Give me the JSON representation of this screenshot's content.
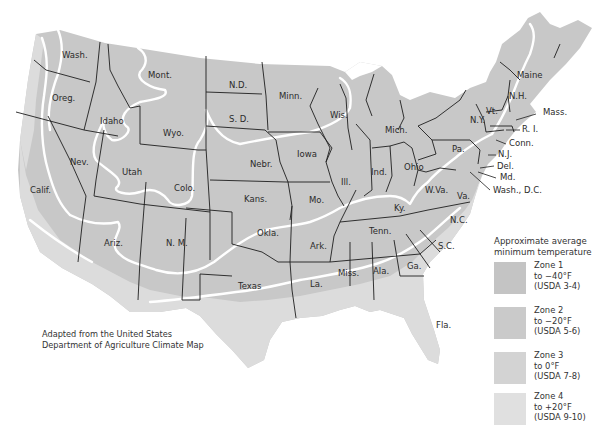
{
  "map": {
    "title": "Plant Hardiness Zones of the United States",
    "colors": {
      "zone1": "#c4c4c4",
      "zone2": "#cacaca",
      "zone3": "#d2d2d2",
      "zone4": "#dedede",
      "border": "#1e1e1e",
      "zone_line": "#ffffff",
      "background": "#ffffff"
    },
    "states": [
      {
        "name": "Wash.",
        "x": 62,
        "y": 58
      },
      {
        "name": "Oreg.",
        "x": 52,
        "y": 101
      },
      {
        "name": "Idaho",
        "x": 100,
        "y": 124
      },
      {
        "name": "Mont.",
        "x": 148,
        "y": 78
      },
      {
        "name": "Wyo.",
        "x": 163,
        "y": 136
      },
      {
        "name": "N.D.",
        "x": 229,
        "y": 88
      },
      {
        "name": "S. D.",
        "x": 229,
        "y": 122
      },
      {
        "name": "Minn.",
        "x": 279,
        "y": 99
      },
      {
        "name": "Wis.",
        "x": 330,
        "y": 118
      },
      {
        "name": "Mich.",
        "x": 385,
        "y": 133
      },
      {
        "name": "Nev.",
        "x": 70,
        "y": 165
      },
      {
        "name": "Utah",
        "x": 122,
        "y": 175
      },
      {
        "name": "Colo.",
        "x": 174,
        "y": 191
      },
      {
        "name": "Nebr.",
        "x": 250,
        "y": 167
      },
      {
        "name": "Iowa",
        "x": 297,
        "y": 157
      },
      {
        "name": "Ill.",
        "x": 341,
        "y": 185
      },
      {
        "name": "Ind.",
        "x": 371,
        "y": 175
      },
      {
        "name": "Ohio",
        "x": 404,
        "y": 170
      },
      {
        "name": "Calif.",
        "x": 30,
        "y": 193
      },
      {
        "name": "Kans.",
        "x": 244,
        "y": 202
      },
      {
        "name": "Mo.",
        "x": 309,
        "y": 203
      },
      {
        "name": "Ky.",
        "x": 394,
        "y": 211
      },
      {
        "name": "W.Va.",
        "x": 425,
        "y": 193
      },
      {
        "name": "Va.",
        "x": 457,
        "y": 199
      },
      {
        "name": "N.Y.",
        "x": 470,
        "y": 123
      },
      {
        "name": "Pa.",
        "x": 452,
        "y": 152
      },
      {
        "name": "Vt.",
        "x": 486,
        "y": 114
      },
      {
        "name": "N.H.",
        "x": 509,
        "y": 99
      },
      {
        "name": "Maine",
        "x": 517,
        "y": 78
      },
      {
        "name": "Tenn.",
        "x": 369,
        "y": 234
      },
      {
        "name": "N.C.",
        "x": 450,
        "y": 223
      },
      {
        "name": "S.C.",
        "x": 438,
        "y": 249
      },
      {
        "name": "Okla.",
        "x": 257,
        "y": 236
      },
      {
        "name": "Ark.",
        "x": 310,
        "y": 249
      },
      {
        "name": "Ariz.",
        "x": 104,
        "y": 246
      },
      {
        "name": "N. M.",
        "x": 166,
        "y": 246
      },
      {
        "name": "Texas",
        "x": 238,
        "y": 289
      },
      {
        "name": "La.",
        "x": 310,
        "y": 287
      },
      {
        "name": "Miss.",
        "x": 338,
        "y": 276
      },
      {
        "name": "Ala.",
        "x": 373,
        "y": 274
      },
      {
        "name": "Ga.",
        "x": 407,
        "y": 269
      },
      {
        "name": "Fla.",
        "x": 436,
        "y": 328
      }
    ],
    "callouts": [
      {
        "name": "Mass.",
        "x": 543,
        "y": 115
      },
      {
        "name": "R. I.",
        "x": 522,
        "y": 132
      },
      {
        "name": "Conn.",
        "x": 509,
        "y": 146
      },
      {
        "name": "N.J.",
        "x": 498,
        "y": 157
      },
      {
        "name": "Del.",
        "x": 497,
        "y": 169
      },
      {
        "name": "Md.",
        "x": 500,
        "y": 180
      },
      {
        "name": "Wash., D.C.",
        "x": 493,
        "y": 193
      }
    ]
  },
  "credit": {
    "line1": "Adapted from the United States",
    "line2": "Department of Agriculture Climate Map"
  },
  "legend": {
    "title_line1": "Approximate average",
    "title_line2": "minimum temperature",
    "items": [
      {
        "zone": "Zone 1",
        "temp": "to −40°F",
        "usda": "(USDA 3-4)",
        "color": "#c4c4c4"
      },
      {
        "zone": "Zone 2",
        "temp": "to −20°F",
        "usda": "(USDA 5-6)",
        "color": "#cacaca"
      },
      {
        "zone": "Zone 3",
        "temp": "to 0°F",
        "usda": "(USDA 7-8)",
        "color": "#d3d3d3"
      },
      {
        "zone": "Zone 4",
        "temp": "to +20°F",
        "usda": "(USDA 9-10)",
        "color": "#e0e0e0"
      }
    ]
  }
}
